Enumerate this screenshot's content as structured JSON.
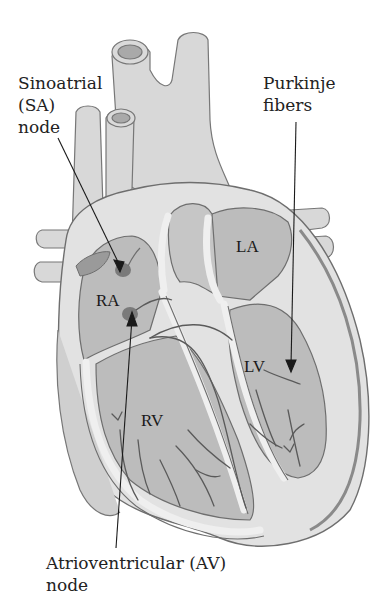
{
  "diagram": {
    "labels": {
      "sa_node": [
        "Sinoatrial",
        "(SA)",
        "node"
      ],
      "purkinje": [
        "Purkinje",
        "fibers"
      ],
      "av_node": [
        "Atrioventricular (AV)",
        "node"
      ]
    },
    "chambers": {
      "ra": "RA",
      "la": "LA",
      "rv": "RV",
      "lv": "LV"
    },
    "colors": {
      "background": "#ffffff",
      "vessel_fill": "#d6d6d6",
      "wall_fill": "#e4e4e4",
      "chamber_fill": "#b9b9b9",
      "node_fill": "#7a7a7a",
      "outline": "#6e6e6e",
      "pointer": "#1a1a1a"
    }
  }
}
